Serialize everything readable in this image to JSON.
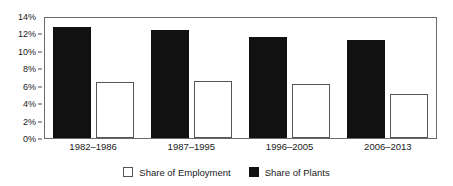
{
  "chart_data": {
    "type": "bar",
    "title": "",
    "subtitle": "",
    "xlabel": "",
    "ylabel": "",
    "categories": [
      "1982–1986",
      "1987–1995",
      "1996–2005",
      "2006–2013"
    ],
    "series": [
      {
        "name": "Share of Employment",
        "style": "open",
        "color": "#ffffff",
        "edge_color": "#555555",
        "values": [
          6.4,
          6.5,
          6.2,
          5.1
        ]
      },
      {
        "name": "Share of Plants",
        "style": "filled",
        "color": "#111111",
        "edge_color": "#111111",
        "values": [
          12.7,
          12.4,
          11.6,
          11.3
        ]
      }
    ],
    "series_draw_order": [
      "Share of Plants",
      "Share of Employment"
    ],
    "ylim": [
      0,
      14
    ],
    "ytick_step": 2,
    "ytick_labels": [
      "0%",
      "2%",
      "4%",
      "6%",
      "8%",
      "10%",
      "12%",
      "14%"
    ],
    "ytick_values": [
      0,
      2,
      4,
      6,
      8,
      10,
      12,
      14
    ],
    "grid": false,
    "frame": true,
    "legend": {
      "position": "bottom-center",
      "entries": [
        {
          "label": "Share of Employment",
          "swatch": "open-square"
        },
        {
          "label": "Share of Plants",
          "swatch": "filled-square"
        }
      ]
    },
    "units": "percent"
  }
}
